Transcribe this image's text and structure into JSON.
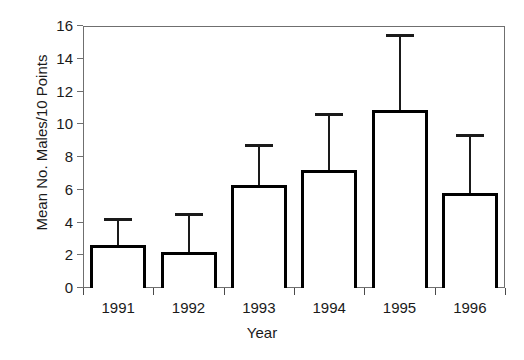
{
  "chart_data": {
    "type": "bar",
    "title": "",
    "xlabel": "Year",
    "ylabel": "Mean No. Males/10 Points",
    "categories": [
      "1991",
      "1992",
      "1993",
      "1994",
      "1995",
      "1996"
    ],
    "values": [
      2.6,
      2.2,
      6.3,
      7.2,
      10.9,
      5.8
    ],
    "error_upper": [
      4.3,
      4.6,
      8.8,
      10.7,
      15.5,
      9.4
    ],
    "errors": [
      1.7,
      2.4,
      2.5,
      3.5,
      4.6,
      3.6
    ],
    "ylim": [
      0,
      16
    ],
    "yticks": [
      0,
      2,
      4,
      6,
      8,
      10,
      12,
      14,
      16
    ],
    "ytick_labels": [
      "0",
      "2",
      "4",
      "6",
      "8",
      "10",
      "12",
      "14",
      "16"
    ],
    "grid": false,
    "legend": false,
    "bar_color": "#ffffff",
    "bar_edge_color": "#000000",
    "error_bar_color": "#1a1a1a",
    "axis_color": "#6f6f6f",
    "error_bar_direction": "upper-only"
  },
  "axes": {
    "x_title": "Year",
    "y_title": "Mean No. Males/10 Points"
  }
}
